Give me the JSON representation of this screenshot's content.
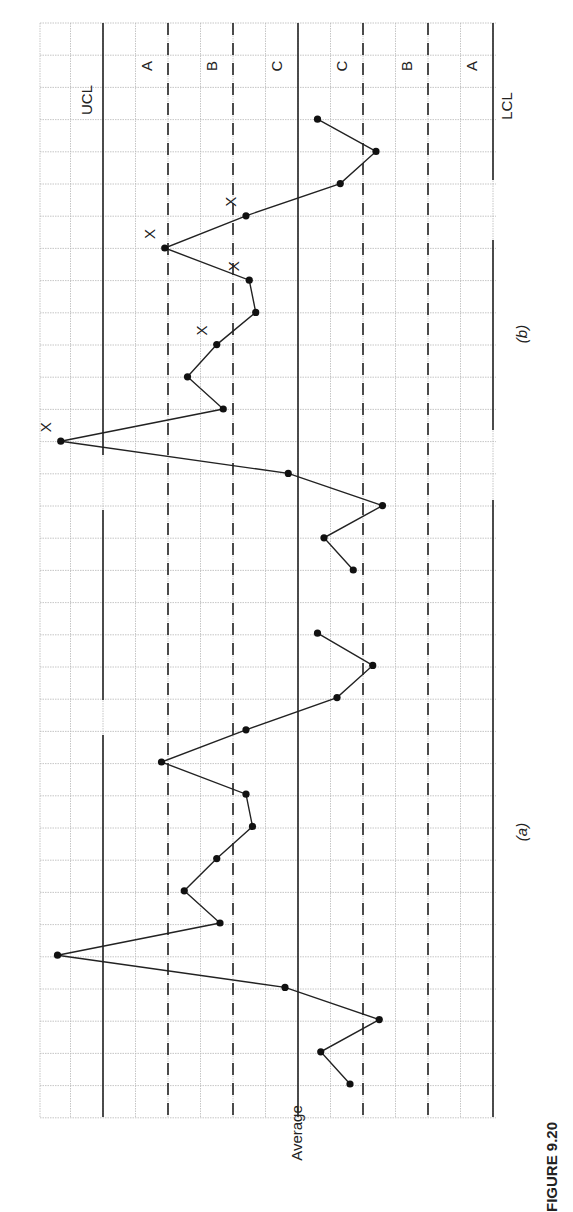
{
  "figure": {
    "caption": "FIGURE 9.20",
    "rotated": "90deg-ccw",
    "average_label": "Average",
    "panel_labels": [
      "(a)",
      "(b)"
    ]
  },
  "zones": {
    "upper": [
      "A",
      "B",
      "C"
    ],
    "lower": [
      "C",
      "B",
      "A"
    ],
    "ucl_label": "UCL",
    "lcl_label": "LCL"
  },
  "chart_data": {
    "type": "line",
    "title": "FIGURE 9.20",
    "xlabel": "Sample (time)",
    "ylabel": "Average",
    "y_units": "sigma from centerline (zones: C = 0–1σ, B = 1–2σ, A = 2–3σ)",
    "ylim": [
      -3,
      3
    ],
    "grid": true,
    "control_lines": {
      "UCL": 3,
      "A_B_upper": 2,
      "B_C_upper": 1,
      "Average": 0,
      "C_B_lower": -1,
      "B_A_lower": -2,
      "LCL": -3
    },
    "series": [
      {
        "name": "(a)",
        "x": [
          1,
          2,
          3,
          4,
          5,
          6,
          7,
          8,
          9,
          10,
          11,
          12,
          13,
          14,
          15
        ],
        "values": [
          -0.8,
          -0.35,
          -1.25,
          0.2,
          3.7,
          1.2,
          1.75,
          1.25,
          0.7,
          0.8,
          2.1,
          0.8,
          -0.6,
          -1.15,
          -0.3
        ],
        "flags": []
      },
      {
        "name": "(b)",
        "x": [
          1,
          2,
          3,
          4,
          5,
          6,
          7,
          8,
          9,
          10,
          11,
          12,
          13,
          14,
          15
        ],
        "values": [
          -0.85,
          -0.4,
          -1.3,
          0.15,
          3.65,
          1.15,
          1.7,
          1.25,
          0.65,
          0.75,
          2.05,
          0.8,
          -0.65,
          -1.2,
          -0.3
        ],
        "flags": [
          {
            "x": 5,
            "mark": "X",
            "note": "beyond UCL"
          },
          {
            "x": 8,
            "mark": "X"
          },
          {
            "x": 10,
            "mark": "X"
          },
          {
            "x": 11,
            "mark": "X"
          },
          {
            "x": 12,
            "mark": "X"
          }
        ]
      }
    ]
  },
  "layout": {
    "left": 40,
    "right": 496,
    "top": 23,
    "bottom": 1117,
    "col_px": 32.5,
    "row_px": 32.2,
    "avg_x": 298,
    "panel_a_start_y": 1084,
    "panel_b_start_y": 570
  },
  "colors": {
    "line": "#222222",
    "grid": "#b8b8b8",
    "point": "#111111"
  }
}
